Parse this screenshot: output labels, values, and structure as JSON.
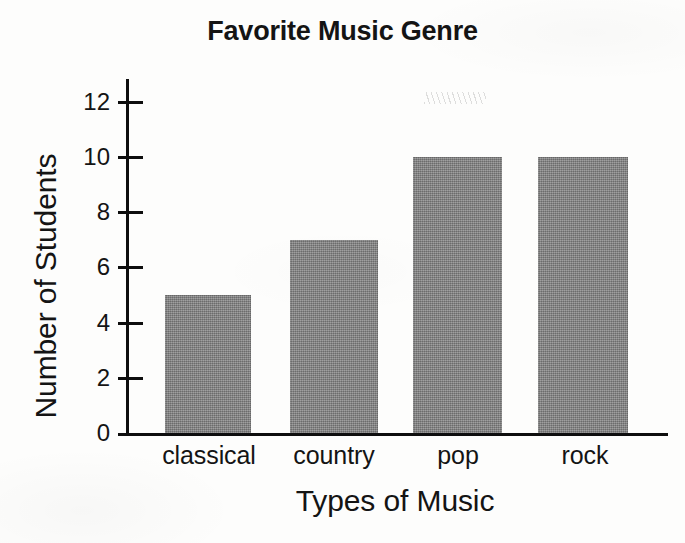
{
  "chart_data": {
    "type": "bar",
    "title": "Favorite Music Genre",
    "xlabel": "Types of Music",
    "ylabel": "Number of Students",
    "categories": [
      "classical",
      "country",
      "pop",
      "rock"
    ],
    "values": [
      5,
      7,
      10,
      10
    ],
    "ylim": [
      0,
      13
    ],
    "yticks": [
      0,
      2,
      4,
      6,
      8,
      10,
      12
    ],
    "ytick_labels": [
      "0",
      "2",
      "4",
      "6",
      "8",
      "10",
      "12"
    ],
    "grid": false,
    "legend": false,
    "bar_color": "#848484",
    "axis_color": "#0e0e0e",
    "text_color": "#141414",
    "background": "#fdfdfc"
  },
  "bars": [
    {
      "category": "classical",
      "value": 5,
      "label": "classical"
    },
    {
      "category": "country",
      "value": 7,
      "label": "country"
    },
    {
      "category": "pop",
      "value": 10,
      "label": "pop"
    },
    {
      "category": "rock",
      "value": 10,
      "label": "rock"
    }
  ],
  "yticks": [
    {
      "value": 12,
      "label": "12"
    },
    {
      "value": 10,
      "label": "10"
    },
    {
      "value": 8,
      "label": "8"
    },
    {
      "value": 6,
      "label": "6"
    },
    {
      "value": 4,
      "label": "4"
    },
    {
      "value": 2,
      "label": "2"
    },
    {
      "value": 0,
      "label": "0"
    }
  ]
}
